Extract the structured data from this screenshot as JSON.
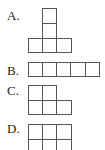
{
  "options": [
    {
      "label": "A.",
      "description": "T-shape: two stacked squares above the center of a row of three"
    },
    {
      "label": "B.",
      "description": "Row of five squares"
    },
    {
      "label": "C.",
      "description": "Two squares on top-left over a row of three"
    },
    {
      "label": "D.",
      "description": "Two rows of three squares"
    }
  ],
  "style": {
    "line_color": "#555555",
    "background": "#ffffff",
    "text_color": "#222222"
  }
}
